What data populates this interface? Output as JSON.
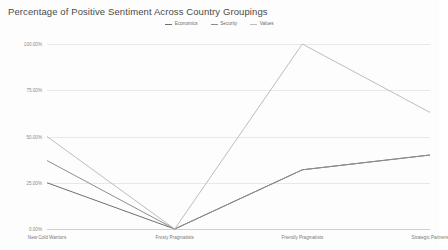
{
  "chart_data": {
    "type": "line",
    "title": "Percentage of Positive Sentiment Across Country Groupings",
    "xlabel": "",
    "ylabel": "",
    "ylim": [
      0,
      100
    ],
    "yticks": [
      0,
      25,
      50,
      75,
      100
    ],
    "ytick_labels": [
      "0.00%",
      "25.00%",
      "50.00%",
      "75.00%",
      "100.00%"
    ],
    "grid": true,
    "legend_position": "top-center",
    "categories": [
      "New Cold Warriors",
      "Frosty Pragmatists",
      "Friendly Pragmatists",
      "Strategic Partners"
    ],
    "series": [
      {
        "name": "Economics",
        "color": "#6e6e6e",
        "values": [
          25,
          0,
          32,
          40
        ]
      },
      {
        "name": "Security",
        "color": "#8e8e8e",
        "values": [
          37,
          0,
          32,
          40
        ]
      },
      {
        "name": "Values",
        "color": "#bdbdbd",
        "values": [
          50,
          0,
          100,
          63
        ]
      }
    ]
  },
  "legend": {
    "items": [
      {
        "label": "Economics",
        "color": "#6e6e6e"
      },
      {
        "label": "Security",
        "color": "#8e8e8e"
      },
      {
        "label": "Values",
        "color": "#bdbdbd"
      }
    ]
  }
}
